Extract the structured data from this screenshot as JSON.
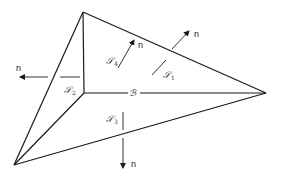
{
  "diagram": {
    "type": "tetrahedron-surfaces",
    "colors": {
      "line": "#1a1a1a",
      "background": "#ffffff"
    },
    "vertices": {
      "top": [
        83,
        12
      ],
      "right": [
        266,
        93
      ],
      "bottom_left": [
        14,
        165
      ],
      "inner": [
        84,
        93
      ]
    },
    "surfaces": [
      {
        "id": "S1",
        "symbol": "𝒮",
        "subscript": "1"
      },
      {
        "id": "S2",
        "symbol": "𝒮",
        "subscript": "2"
      },
      {
        "id": "S3",
        "symbol": "𝒮",
        "subscript": "3"
      },
      {
        "id": "S4",
        "symbol": "𝒮",
        "subscript": "4"
      }
    ],
    "center_label": "ℬ",
    "normal_label": "n",
    "normals": [
      {
        "name": "normal-s1",
        "label": "n"
      },
      {
        "name": "normal-s2",
        "label": "n"
      },
      {
        "name": "normal-s3",
        "label": "n"
      },
      {
        "name": "normal-s4",
        "label": "n"
      }
    ]
  }
}
